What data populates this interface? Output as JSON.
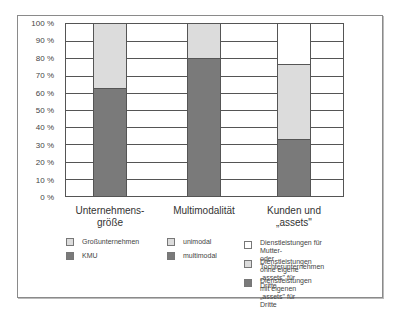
{
  "chart_data": {
    "type": "bar",
    "stacked": true,
    "percent_stacked": true,
    "title": "",
    "xlabel": "",
    "ylabel": "",
    "ylim": [
      0,
      100
    ],
    "grid": true,
    "y_ticks": [
      "0 %",
      "10 %",
      "20 %",
      "30 %",
      "40 %",
      "50 %",
      "60 %",
      "70 %",
      "80 %",
      "90 %",
      "100 %"
    ],
    "categories": [
      "Unternehmens-\ngröße",
      "Multimodalität",
      "Kunden und\n„assets\""
    ],
    "groups": [
      {
        "category": "Unternehmensgröße",
        "series": [
          {
            "name": "KMU",
            "value": 63,
            "color": "#7a7a7a"
          },
          {
            "name": "Großunternehmen",
            "value": 37,
            "color": "#dcdcdc"
          }
        ]
      },
      {
        "category": "Multimodalität",
        "series": [
          {
            "name": "multimodal",
            "value": 80,
            "color": "#7a7a7a"
          },
          {
            "name": "unimodal",
            "value": 20,
            "color": "#dcdcdc"
          }
        ]
      },
      {
        "category": "Kunden und „assets\"",
        "series": [
          {
            "name": "Dienstleistungen mit eigenen „assets\" für Dritte",
            "value": 33,
            "color": "#7a7a7a"
          },
          {
            "name": "Dienstleistungen ohne eigene „assets\" für Dritte",
            "value": 44,
            "color": "#dcdcdc"
          },
          {
            "name": "Dienstleistungen für Mutter- oder Tochterunternehmen",
            "value": 23,
            "color": "#ffffff"
          }
        ]
      }
    ],
    "legend_position": "bottom"
  },
  "axis": {
    "y_labels": [
      "0 %",
      "10 %",
      "20 %",
      "30 %",
      "40 %",
      "50 %",
      "60 %",
      "70 %",
      "80 %",
      "90 %",
      "100 %"
    ]
  },
  "categories": {
    "c1": "Unternehmens-\ngröße",
    "c2": "Multimodalität",
    "c3": "Kunden und\n„assets\""
  },
  "legend": {
    "g1": [
      {
        "label": "Großunternehmen",
        "color": "#dcdcdc"
      },
      {
        "label": "KMU",
        "color": "#7a7a7a"
      }
    ],
    "g2": [
      {
        "label": "unimodal",
        "color": "#dcdcdc"
      },
      {
        "label": "multimodal",
        "color": "#7a7a7a"
      }
    ],
    "g3": [
      {
        "label": "Dienstleistungen für Mutter-\noder Tochterunternehmen",
        "color": "#ffffff"
      },
      {
        "label": "Dienstleistungen ohne eigene\n„assets\" für Dritte",
        "color": "#dcdcdc"
      },
      {
        "label": "Dienstleistungen mit eigenen\n„assets\" für Dritte",
        "color": "#7a7a7a"
      }
    ]
  }
}
